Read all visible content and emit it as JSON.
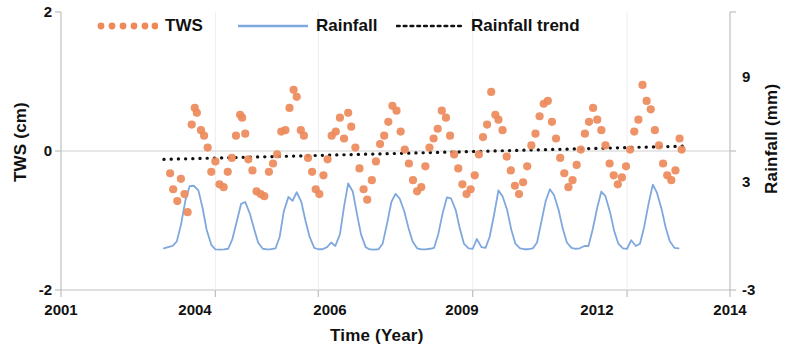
{
  "chart_data": {
    "type": "line",
    "title": "",
    "xlabel": "Time (Year)",
    "ylabel": "TWS (cm)",
    "y2label": "Rainfall (mm)",
    "xlim": [
      2001,
      2014
    ],
    "ylim": [
      -2,
      2
    ],
    "y2lim": [
      -3,
      9
    ],
    "xticks": [
      2001,
      2004,
      2006,
      2009,
      2012,
      2014
    ],
    "xticklabels": [
      "2001",
      "2004",
      "2006",
      "2009",
      "2012",
      "2014"
    ],
    "yticks": [
      -2,
      0,
      2
    ],
    "yticklabels": [
      "-2",
      "0",
      "2"
    ],
    "y2ticks": [
      -3,
      3,
      9
    ],
    "y2ticklabels": [
      "-3",
      "3",
      "9"
    ],
    "grid": false,
    "legend_position": "top",
    "legend": [
      {
        "name": "TWS",
        "marker": "dotted-circles",
        "color": "#ED8A5A"
      },
      {
        "name": "Rainfall",
        "marker": "line",
        "color": "#7FA8DE"
      },
      {
        "name": "Rainfall trend",
        "marker": "dotted-line",
        "color": "#111111"
      }
    ],
    "series": [
      {
        "name": "Rainfall",
        "axis": "right",
        "type": "line",
        "color": "#7FA8DE",
        "points": [
          [
            2003.0,
            -1.2
          ],
          [
            2003.08,
            -1.15
          ],
          [
            2003.17,
            -1.1
          ],
          [
            2003.25,
            -0.9
          ],
          [
            2003.33,
            -0.2
          ],
          [
            2003.42,
            0.9
          ],
          [
            2003.5,
            1.48
          ],
          [
            2003.58,
            1.5
          ],
          [
            2003.67,
            1.3
          ],
          [
            2003.75,
            0.55
          ],
          [
            2003.83,
            -0.4
          ],
          [
            2003.92,
            -1.05
          ],
          [
            2004.0,
            -1.25
          ],
          [
            2004.08,
            -1.26
          ],
          [
            2004.17,
            -1.25
          ],
          [
            2004.25,
            -1.22
          ],
          [
            2004.33,
            -0.8
          ],
          [
            2004.42,
            0.0
          ],
          [
            2004.5,
            0.72
          ],
          [
            2004.58,
            0.8
          ],
          [
            2004.67,
            0.3
          ],
          [
            2004.75,
            -0.35
          ],
          [
            2004.83,
            -0.95
          ],
          [
            2004.92,
            -1.22
          ],
          [
            2005.0,
            -1.25
          ],
          [
            2005.08,
            -1.24
          ],
          [
            2005.17,
            -1.2
          ],
          [
            2005.25,
            -0.7
          ],
          [
            2005.33,
            0.4
          ],
          [
            2005.42,
            1.02
          ],
          [
            2005.5,
            0.85
          ],
          [
            2005.58,
            1.22
          ],
          [
            2005.67,
            0.8
          ],
          [
            2005.75,
            0.0
          ],
          [
            2005.83,
            -0.7
          ],
          [
            2005.92,
            -1.18
          ],
          [
            2006.0,
            -1.24
          ],
          [
            2006.08,
            -1.24
          ],
          [
            2006.17,
            -1.15
          ],
          [
            2006.25,
            -0.95
          ],
          [
            2006.33,
            -1.1
          ],
          [
            2006.42,
            -0.6
          ],
          [
            2006.5,
            0.6
          ],
          [
            2006.58,
            1.6
          ],
          [
            2006.67,
            1.25
          ],
          [
            2006.75,
            0.3
          ],
          [
            2006.83,
            -0.6
          ],
          [
            2006.92,
            -1.15
          ],
          [
            2007.0,
            -1.25
          ],
          [
            2007.08,
            -1.26
          ],
          [
            2007.17,
            -1.24
          ],
          [
            2007.25,
            -1.0
          ],
          [
            2007.33,
            -0.2
          ],
          [
            2007.42,
            0.8
          ],
          [
            2007.5,
            1.15
          ],
          [
            2007.58,
            0.95
          ],
          [
            2007.67,
            0.4
          ],
          [
            2007.75,
            -0.3
          ],
          [
            2007.83,
            -0.9
          ],
          [
            2007.92,
            -1.2
          ],
          [
            2008.0,
            -1.25
          ],
          [
            2008.08,
            -1.25
          ],
          [
            2008.17,
            -1.22
          ],
          [
            2008.25,
            -1.18
          ],
          [
            2008.33,
            -0.6
          ],
          [
            2008.42,
            0.35
          ],
          [
            2008.5,
            1.0
          ],
          [
            2008.58,
            0.95
          ],
          [
            2008.67,
            0.45
          ],
          [
            2008.75,
            -0.35
          ],
          [
            2008.83,
            -1.0
          ],
          [
            2008.92,
            -1.2
          ],
          [
            2009.0,
            -1.22
          ],
          [
            2009.08,
            -0.8
          ],
          [
            2009.17,
            -1.15
          ],
          [
            2009.25,
            -1.18
          ],
          [
            2009.33,
            -0.7
          ],
          [
            2009.42,
            0.3
          ],
          [
            2009.5,
            1.3
          ],
          [
            2009.58,
            1.05
          ],
          [
            2009.67,
            0.45
          ],
          [
            2009.75,
            -0.4
          ],
          [
            2009.83,
            -1.0
          ],
          [
            2009.92,
            -1.2
          ],
          [
            2010.0,
            -1.24
          ],
          [
            2010.08,
            -1.24
          ],
          [
            2010.17,
            -1.2
          ],
          [
            2010.25,
            -0.95
          ],
          [
            2010.33,
            -0.1
          ],
          [
            2010.42,
            0.85
          ],
          [
            2010.5,
            1.35
          ],
          [
            2010.58,
            1.1
          ],
          [
            2010.67,
            0.45
          ],
          [
            2010.75,
            -0.35
          ],
          [
            2010.83,
            -0.95
          ],
          [
            2010.92,
            -1.18
          ],
          [
            2011.0,
            -1.22
          ],
          [
            2011.08,
            -1.2
          ],
          [
            2011.17,
            -1.1
          ],
          [
            2011.25,
            -1.1
          ],
          [
            2011.33,
            -0.4
          ],
          [
            2011.42,
            0.55
          ],
          [
            2011.5,
            1.25
          ],
          [
            2011.58,
            1.05
          ],
          [
            2011.67,
            0.35
          ],
          [
            2011.75,
            -0.45
          ],
          [
            2011.83,
            -1.0
          ],
          [
            2011.92,
            -1.2
          ],
          [
            2012.0,
            -1.22
          ],
          [
            2012.08,
            -0.85
          ],
          [
            2012.17,
            -1.1
          ],
          [
            2012.25,
            -1.0
          ],
          [
            2012.33,
            -0.3
          ],
          [
            2012.42,
            0.75
          ],
          [
            2012.5,
            1.55
          ],
          [
            2012.58,
            1.2
          ],
          [
            2012.67,
            0.5
          ],
          [
            2012.75,
            -0.3
          ],
          [
            2012.83,
            -0.9
          ],
          [
            2012.92,
            -1.18
          ],
          [
            2013.0,
            -1.2
          ]
        ]
      },
      {
        "name": "Rainfall trend",
        "axis": "left",
        "type": "dotted-line",
        "color": "#111111",
        "points": [
          [
            2003.0,
            -0.12
          ],
          [
            2013.1,
            0.07
          ]
        ]
      },
      {
        "name": "TWS",
        "axis": "left",
        "type": "scatter",
        "color": "#ED8A5A",
        "points": [
          [
            2003.12,
            -0.32
          ],
          [
            2003.18,
            -0.55
          ],
          [
            2003.26,
            -0.72
          ],
          [
            2003.33,
            -0.4
          ],
          [
            2003.4,
            -0.62
          ],
          [
            2003.46,
            -0.88
          ],
          [
            2003.54,
            0.38
          ],
          [
            2003.6,
            0.62
          ],
          [
            2003.64,
            0.55
          ],
          [
            2003.72,
            0.3
          ],
          [
            2003.78,
            0.22
          ],
          [
            2003.85,
            0.05
          ],
          [
            2003.92,
            -0.3
          ],
          [
            2004.0,
            -0.15
          ],
          [
            2004.08,
            -0.48
          ],
          [
            2004.16,
            -0.52
          ],
          [
            2004.24,
            -0.3
          ],
          [
            2004.32,
            -0.1
          ],
          [
            2004.4,
            0.22
          ],
          [
            2004.48,
            0.52
          ],
          [
            2004.52,
            0.48
          ],
          [
            2004.58,
            0.25
          ],
          [
            2004.64,
            -0.12
          ],
          [
            2004.72,
            -0.28
          ],
          [
            2004.8,
            -0.58
          ],
          [
            2004.88,
            -0.62
          ],
          [
            2004.95,
            -0.65
          ],
          [
            2005.04,
            -0.3
          ],
          [
            2005.12,
            -0.18
          ],
          [
            2005.2,
            -0.05
          ],
          [
            2005.28,
            0.28
          ],
          [
            2005.36,
            0.3
          ],
          [
            2005.44,
            0.62
          ],
          [
            2005.52,
            0.88
          ],
          [
            2005.58,
            0.78
          ],
          [
            2005.66,
            0.3
          ],
          [
            2005.72,
            0.22
          ],
          [
            2005.8,
            -0.1
          ],
          [
            2005.88,
            -0.3
          ],
          [
            2005.95,
            -0.55
          ],
          [
            2006.02,
            -0.62
          ],
          [
            2006.1,
            -0.35
          ],
          [
            2006.18,
            -0.12
          ],
          [
            2006.26,
            0.22
          ],
          [
            2006.34,
            0.28
          ],
          [
            2006.42,
            0.48
          ],
          [
            2006.5,
            0.18
          ],
          [
            2006.58,
            0.55
          ],
          [
            2006.64,
            0.35
          ],
          [
            2006.72,
            0.05
          ],
          [
            2006.8,
            -0.25
          ],
          [
            2006.88,
            -0.55
          ],
          [
            2006.95,
            -0.7
          ],
          [
            2007.04,
            -0.42
          ],
          [
            2007.12,
            -0.15
          ],
          [
            2007.2,
            0.1
          ],
          [
            2007.28,
            0.22
          ],
          [
            2007.36,
            0.42
          ],
          [
            2007.44,
            0.65
          ],
          [
            2007.52,
            0.58
          ],
          [
            2007.6,
            0.28
          ],
          [
            2007.68,
            0.02
          ],
          [
            2007.76,
            -0.18
          ],
          [
            2007.84,
            -0.42
          ],
          [
            2007.92,
            -0.58
          ],
          [
            2008.0,
            -0.52
          ],
          [
            2008.08,
            -0.22
          ],
          [
            2008.16,
            0.05
          ],
          [
            2008.24,
            0.18
          ],
          [
            2008.32,
            0.32
          ],
          [
            2008.4,
            0.58
          ],
          [
            2008.48,
            0.48
          ],
          [
            2008.56,
            0.22
          ],
          [
            2008.64,
            -0.05
          ],
          [
            2008.72,
            -0.25
          ],
          [
            2008.8,
            -0.48
          ],
          [
            2008.88,
            -0.62
          ],
          [
            2008.96,
            -0.55
          ],
          [
            2009.04,
            -0.35
          ],
          [
            2009.12,
            -0.05
          ],
          [
            2009.2,
            0.2
          ],
          [
            2009.28,
            0.38
          ],
          [
            2009.36,
            0.85
          ],
          [
            2009.44,
            0.52
          ],
          [
            2009.5,
            0.45
          ],
          [
            2009.58,
            0.3
          ],
          [
            2009.66,
            -0.08
          ],
          [
            2009.74,
            -0.28
          ],
          [
            2009.82,
            -0.5
          ],
          [
            2009.9,
            -0.62
          ],
          [
            2009.98,
            -0.45
          ],
          [
            2010.06,
            -0.22
          ],
          [
            2010.14,
            0.08
          ],
          [
            2010.22,
            0.25
          ],
          [
            2010.3,
            0.5
          ],
          [
            2010.38,
            0.68
          ],
          [
            2010.46,
            0.72
          ],
          [
            2010.54,
            0.42
          ],
          [
            2010.62,
            0.18
          ],
          [
            2010.7,
            -0.1
          ],
          [
            2010.78,
            -0.32
          ],
          [
            2010.86,
            -0.52
          ],
          [
            2010.94,
            -0.42
          ],
          [
            2011.02,
            -0.2
          ],
          [
            2011.1,
            0.02
          ],
          [
            2011.18,
            0.25
          ],
          [
            2011.26,
            0.42
          ],
          [
            2011.34,
            0.62
          ],
          [
            2011.42,
            0.45
          ],
          [
            2011.5,
            0.3
          ],
          [
            2011.58,
            0.08
          ],
          [
            2011.66,
            -0.18
          ],
          [
            2011.74,
            -0.35
          ],
          [
            2011.82,
            -0.48
          ],
          [
            2011.9,
            -0.38
          ],
          [
            2011.98,
            -0.22
          ],
          [
            2012.06,
            0.02
          ],
          [
            2012.14,
            0.28
          ],
          [
            2012.22,
            0.45
          ],
          [
            2012.3,
            0.95
          ],
          [
            2012.38,
            0.72
          ],
          [
            2012.46,
            0.6
          ],
          [
            2012.54,
            0.3
          ],
          [
            2012.62,
            0.08
          ],
          [
            2012.7,
            -0.18
          ],
          [
            2012.78,
            -0.35
          ],
          [
            2012.86,
            -0.42
          ],
          [
            2012.94,
            -0.28
          ],
          [
            2013.02,
            0.18
          ],
          [
            2013.06,
            0.02
          ]
        ]
      }
    ]
  },
  "axes": {
    "left_label": "TWS (cm)",
    "right_label": "Rainfall (mm)",
    "bottom_label": "Time (Year)",
    "left_ticks": [
      "2",
      "0",
      "-2"
    ],
    "right_ticks": [
      "9",
      "3",
      "-3"
    ],
    "bottom_ticks": [
      "2001",
      "2004",
      "2006",
      "2009",
      "2012",
      "2014"
    ]
  },
  "legend": {
    "tws": "TWS",
    "rainfall": "Rainfall",
    "rainfall_trend": "Rainfall trend"
  },
  "colors": {
    "tws": "#ED8A5A",
    "rainfall": "#7FA8DE",
    "trend": "#111111",
    "axis": "#BFBFBF",
    "text": "#111111"
  }
}
